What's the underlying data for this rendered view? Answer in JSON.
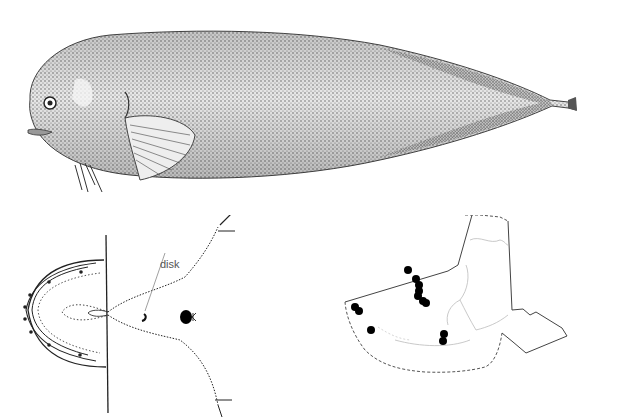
{
  "figure": {
    "panels": [
      {
        "id": "lateral-view",
        "description": "Lateral view of fish, stippled illustration"
      },
      {
        "id": "ventral-view",
        "description": "Ventral view of head showing disk"
      },
      {
        "id": "distribution-map",
        "description": "Alaska distribution map with record points"
      }
    ]
  },
  "ventral": {
    "disk_label": "disk"
  },
  "map": {
    "points": [
      {
        "x": 78,
        "y": 55
      },
      {
        "x": 86,
        "y": 64
      },
      {
        "x": 89,
        "y": 70
      },
      {
        "x": 89,
        "y": 76
      },
      {
        "x": 88,
        "y": 81
      },
      {
        "x": 93,
        "y": 86
      },
      {
        "x": 96,
        "y": 88
      },
      {
        "x": 25,
        "y": 92
      },
      {
        "x": 29,
        "y": 96
      },
      {
        "x": 41,
        "y": 115
      },
      {
        "x": 114,
        "y": 119
      },
      {
        "x": 113,
        "y": 126
      }
    ],
    "colors": {
      "points": "#000000",
      "outline": "#555555",
      "coast": "#bbbbbb"
    }
  }
}
